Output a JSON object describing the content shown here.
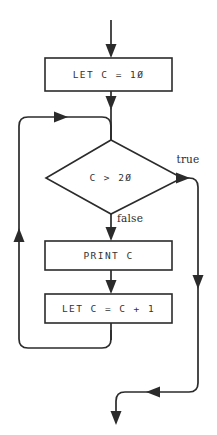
{
  "diagram": {
    "type": "flowchart",
    "colors": {
      "background": "#ffffff",
      "line": "#2b2b2b",
      "text": "#333333",
      "label_text": "#2b2b2b"
    },
    "nodes": {
      "init": {
        "shape": "process",
        "text": "LET C = 1Ø"
      },
      "condition": {
        "shape": "decision",
        "text": "C > 2Ø"
      },
      "print": {
        "shape": "process",
        "text": "PRINT C"
      },
      "increment": {
        "shape": "process",
        "text": "LET C = C + 1"
      }
    },
    "branch_labels": {
      "true": "true",
      "false": "false"
    }
  }
}
